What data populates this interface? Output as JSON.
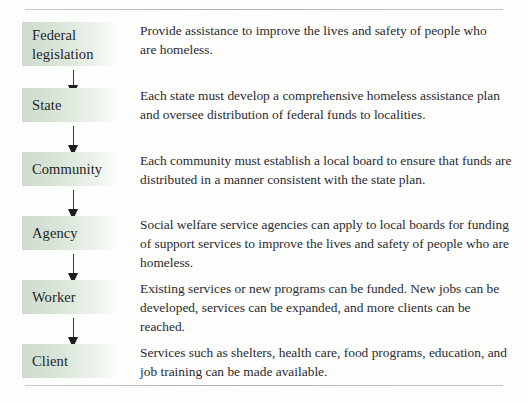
{
  "figure": {
    "rules": {
      "top": true,
      "bottom": true
    },
    "colors": {
      "node_gradient_start": "#cfdccf",
      "node_gradient_end": "#ffffff",
      "arrow": "#1c1c1c",
      "rule": "#b4b4ae",
      "text": "#2a2a2e"
    }
  },
  "steps": [
    {
      "level": "Federal\nlegislation",
      "description": "Provide assistance to improve the lives and safety of people who are homeless."
    },
    {
      "level": "State",
      "description": "Each state must develop a comprehensive homeless assistance plan and oversee distribution of federal funds to localities."
    },
    {
      "level": "Community",
      "description": "Each community must establish a local board to ensure that funds are distributed in a manner consistent with the state plan."
    },
    {
      "level": "Agency",
      "description": "Social welfare service agencies can apply to local boards for funding of support services to improve the lives and safety of people who are homeless."
    },
    {
      "level": "Worker",
      "description": "Existing services or new programs can be funded. New jobs can be developed, services can be expanded, and more clients can be reached."
    },
    {
      "level": "Client",
      "description": "Services such as shelters, health care, food programs, education, and job training can be made available."
    }
  ]
}
